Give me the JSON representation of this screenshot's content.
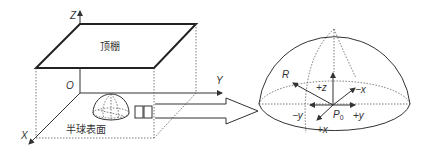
{
  "left_scene": {
    "axes": {
      "z": "Z",
      "y": "Y",
      "x": "X",
      "origin": "O"
    },
    "ceiling_label": "顶棚",
    "hemisphere_label": "半球表面"
  },
  "right_detail": {
    "radius_label": "R",
    "center_label": "P",
    "center_subscript": "0",
    "directions": {
      "pz": "+z",
      "nx": "−x",
      "ny": "−y",
      "py": "+y",
      "px": "+x"
    }
  },
  "colors": {
    "line": "#333333",
    "background": "#ffffff"
  }
}
